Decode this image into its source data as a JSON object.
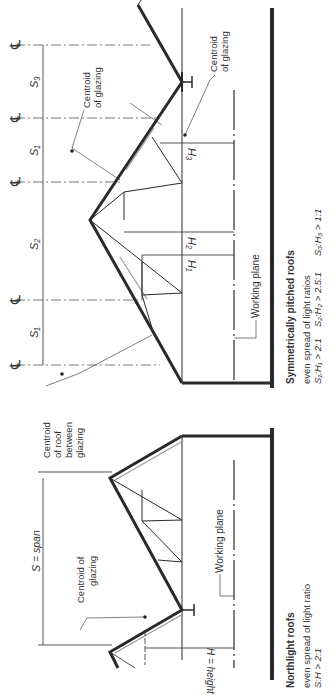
{
  "figure": {
    "orientation": "rotated -90deg (text reads bottom-to-top)",
    "symmetric": {
      "title": "Symmetrically pitched roofs",
      "subtitle": "even spread of light ratios",
      "ratios": [
        "S₁:H₁ > 2:1",
        "S₂:H₂ > 2.5:1",
        "S₃:H₃ > 1:1"
      ],
      "span_labels": [
        "S₁",
        "S₂",
        "S₁",
        "S₃"
      ],
      "height_labels": [
        "H₁",
        "H₂",
        "H₃"
      ],
      "centroid_glazing_1": [
        "Centroid",
        "of glazing"
      ],
      "centroid_glazing_2": [
        "Centroid",
        "of glazing"
      ],
      "centroid_roof": [
        "Centroid",
        "of roof",
        "between",
        "glazing"
      ],
      "working_plane": "Working plane",
      "centerline_symbol": "℄"
    },
    "northlight": {
      "title": "Northlight roofs",
      "subtitle": "even spread of light ratio",
      "ratio": "S:H > 2:1",
      "span_label": "S = span",
      "height_label": "H = height",
      "centroid_glazing": [
        "Centroid of",
        "glazing"
      ],
      "working_plane": "Working plane"
    },
    "colors": {
      "line": "#2a2a2a",
      "thin": "#444444",
      "floor": "#333333",
      "glazing": "#9a9a9a"
    }
  }
}
